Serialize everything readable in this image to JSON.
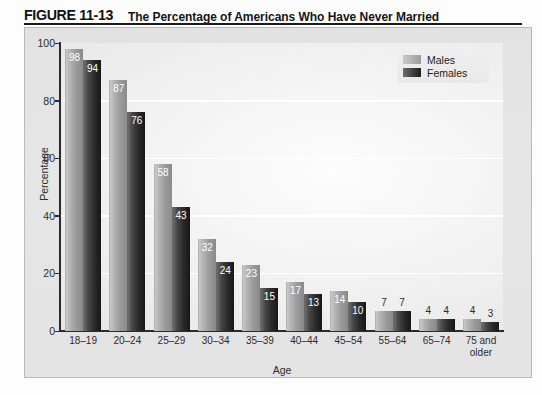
{
  "title": {
    "figure_number": "FIGURE 11-13",
    "text": "The Percentage of Americans Who Have Never Married"
  },
  "legend": {
    "position": "top-right",
    "male_label": "Males",
    "female_label": "Females",
    "male_color": "#a8a8a8",
    "female_color": "#232323"
  },
  "chart_data": {
    "type": "bar",
    "title": "The Percentage of Americans Who Have Never Married",
    "xlabel": "Age",
    "ylabel": "Percentage",
    "ylim": [
      0,
      100
    ],
    "yticks": [
      0,
      20,
      40,
      60,
      80,
      100
    ],
    "ytick_labels": [
      "0",
      "20",
      "40",
      "60",
      "80",
      "100"
    ],
    "grid": "horizontal-white",
    "legend_position": "top-right",
    "categories": [
      "18–19",
      "20–24",
      "25–29",
      "30–34",
      "35–39",
      "40–44",
      "45–54",
      "55–64",
      "65–74",
      "75 and older"
    ],
    "series": [
      {
        "name": "Males",
        "color": "#a8a8a8",
        "values": [
          98,
          87,
          58,
          32,
          23,
          17,
          14,
          7,
          4,
          4
        ]
      },
      {
        "name": "Females",
        "color": "#232323",
        "values": [
          94,
          76,
          43,
          24,
          15,
          13,
          10,
          7,
          4,
          3
        ]
      }
    ]
  }
}
